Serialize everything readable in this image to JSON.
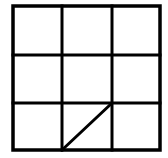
{
  "figure": {
    "background_color": "#ffffff",
    "stroke_color": "#000000",
    "canvas": {
      "width": 168,
      "height": 158
    },
    "grid": {
      "rows": 3,
      "columns": 3,
      "left": 13,
      "top": 6,
      "right": 160,
      "bottom": 150,
      "width": 147,
      "height": 144,
      "outer_stroke_width": 3.5,
      "inner_stroke_width": 3,
      "vertical_divider_x": [
        62,
        112
      ],
      "horizontal_divider_y": [
        55,
        103
      ]
    },
    "diagonal": {
      "cell_row": 3,
      "cell_column": 2,
      "x1": 62,
      "y1": 150,
      "x2": 112,
      "y2": 103,
      "stroke_width": 3
    }
  }
}
